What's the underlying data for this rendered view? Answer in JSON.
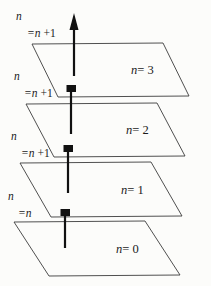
{
  "figure": {
    "type": "layered-planes-diagram",
    "background_color": "#fcfcfa",
    "stroke_color": "#3c3c3c",
    "arrow_color": "#111111",
    "width": 211,
    "height": 286
  },
  "planes": [
    {
      "label_n": "n",
      "label_eq": "= 3",
      "full_label": "n= 3",
      "index": 3
    },
    {
      "label_n": "n",
      "label_eq": "= 2",
      "full_label": "n= 2",
      "index": 2
    },
    {
      "label_n": "n",
      "label_eq": "= 1",
      "full_label": "n= 1",
      "index": 1
    },
    {
      "label_n": "n",
      "label_eq": "= 0",
      "full_label": "n= 0",
      "index": 0
    }
  ],
  "transitions": [
    {
      "line1": "n",
      "line2_var": "=n",
      "line2_op": " +1",
      "full": "n =n +1",
      "marker": "triangle-arrowhead"
    },
    {
      "line1": "n",
      "line2_var": "=n",
      "line2_op": " +1",
      "full": "n =n +1",
      "marker": "square-block"
    },
    {
      "line1": "n",
      "line2_var": "=n",
      "line2_op": " +1",
      "full": "n =n +1",
      "marker": "square-block"
    },
    {
      "line1": "n",
      "line2_var": "=n",
      "line2_op": "",
      "full": "n =n",
      "marker": "square-block"
    }
  ]
}
